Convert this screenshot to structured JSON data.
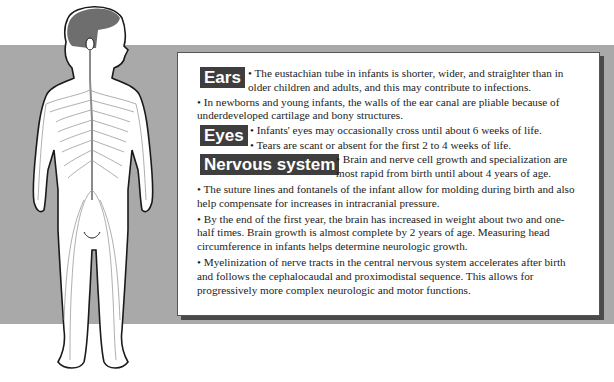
{
  "sections": {
    "ears": {
      "label": "Ears",
      "inline_line1": "• The eustachian tube in infants is shorter, wider, and straighter than in",
      "inline_line2": "older children and adults, and this may contribute to infections.",
      "bullet2_line1": "• In newborns and young infants, the walls of the ear canal are pliable because of",
      "bullet2_line2": "underdeveloped cartilage and bony structures."
    },
    "eyes": {
      "label": "Eyes",
      "bullet1": "• Infants' eyes may occasionally cross until about 6 weeks of life.",
      "bullet2": "• Tears are scant or absent for the first 2 to 4 weeks of life."
    },
    "nervous": {
      "label": "Nervous system",
      "inline_line1": "• Brain and nerve cell growth and specialization are",
      "inline_line2": "most rapid from birth until about 4 years of age.",
      "bullet2_line1": "• The suture lines and fontanels of the infant allow for molding during birth and also",
      "bullet2_line2": "help compensate for increases in intracranial pressure.",
      "bullet3_line1": "• By the end of the first year, the brain has increased in weight about two and one-",
      "bullet3_line2": "half times. Brain growth is almost complete by 2 years of age.  Measuring head",
      "bullet3_line3": "circumference in infants helps determine neurologic growth.",
      "bullet4_line1": "• Myelinization of nerve tracts in the central nervous system accelerates after birth",
      "bullet4_line2": "and follows the cephalocaudal and proximodistal sequence. This allows for",
      "bullet4_line3": "progressively more complex neurologic and motor functions."
    }
  },
  "colors": {
    "band": "#a9a9a9",
    "label_bg": "#3e3e3e",
    "panel_shadow": "#4a4a4a",
    "nerve": "#9a9a9a",
    "hair": "#6e6e6e"
  }
}
